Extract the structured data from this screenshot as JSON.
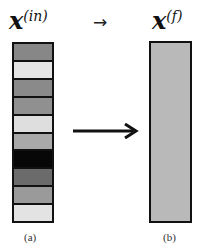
{
  "figure": {
    "left": {
      "title_base": "x",
      "title_sup": "(in)",
      "caption": "(a)",
      "cells": [
        {
          "index": 1,
          "color": "#878787"
        },
        {
          "index": 2,
          "color": "#e5e5e5"
        },
        {
          "index": 3,
          "color": "#8a8a8a"
        },
        {
          "index": 4,
          "color": "#909090"
        },
        {
          "index": 5,
          "color": "#dedede"
        },
        {
          "index": 6,
          "color": "#a9a9a9"
        },
        {
          "index": 7,
          "color": "#070707"
        },
        {
          "index": 8,
          "color": "#6b6b6b"
        },
        {
          "index": 9,
          "color": "#9a9a9a"
        },
        {
          "index": 10,
          "color": "#e3e3e3"
        }
      ]
    },
    "right": {
      "title_base": "x",
      "title_sup": "(f)",
      "caption": "(b)",
      "fill_color": "#b9b9b9"
    },
    "top_arrow": "→",
    "transform_arrow": "arrow-right"
  }
}
